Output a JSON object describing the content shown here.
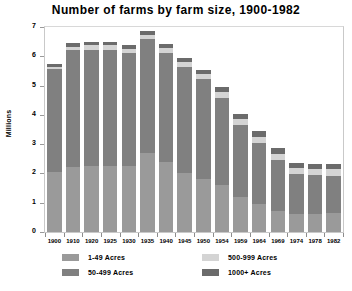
{
  "chart_data": {
    "type": "bar",
    "subtype": "stacked-vertical",
    "title": "Number of farms by farm size, 1900-1982",
    "xlabel": "",
    "ylabel": "Millions",
    "ylim": [
      0,
      7
    ],
    "yticks": [
      0,
      1,
      2,
      3,
      4,
      5,
      6,
      7
    ],
    "grid": false,
    "legend_position": "bottom",
    "categories": [
      "1900",
      "1910",
      "1920",
      "1925",
      "1930",
      "1935",
      "1940",
      "1945",
      "1950",
      "1954",
      "1959",
      "1964",
      "1969",
      "1974",
      "1978",
      "1982"
    ],
    "series": [
      {
        "name": "1-49 Acres",
        "color": "#9a9a9a",
        "values": [
          2.05,
          2.22,
          2.26,
          2.24,
          2.27,
          2.7,
          2.38,
          2.02,
          1.81,
          1.61,
          1.21,
          0.95,
          0.73,
          0.62,
          0.62,
          0.64
        ]
      },
      {
        "name": "50-499 Acres",
        "color": "#808080",
        "values": [
          3.5,
          3.98,
          3.96,
          3.97,
          3.83,
          3.88,
          3.73,
          3.61,
          3.4,
          2.98,
          2.44,
          2.1,
          1.72,
          1.37,
          1.32,
          1.29
        ]
      },
      {
        "name": "500-999 Acres",
        "color": "#d4d4d4",
        "values": [
          0.09,
          0.13,
          0.15,
          0.16,
          0.16,
          0.16,
          0.16,
          0.17,
          0.18,
          0.2,
          0.2,
          0.21,
          0.22,
          0.21,
          0.22,
          0.22
        ]
      },
      {
        "name": "1000+ Acres",
        "color": "#6b6b6b",
        "values": [
          0.1,
          0.12,
          0.12,
          0.12,
          0.13,
          0.13,
          0.14,
          0.15,
          0.16,
          0.17,
          0.18,
          0.19,
          0.2,
          0.16,
          0.16,
          0.16
        ]
      }
    ],
    "totals": [
      5.74,
      6.45,
      6.49,
      6.49,
      6.39,
      6.87,
      6.41,
      5.95,
      5.55,
      4.96,
      4.03,
      3.45,
      2.87,
      2.36,
      2.32,
      2.31
    ]
  },
  "legend": {
    "items": [
      {
        "label": "1-49 Acres",
        "color": "#9a9a9a"
      },
      {
        "label": "50-499 Acres",
        "color": "#808080"
      },
      {
        "label": "500-999 Acres",
        "color": "#d4d4d4"
      },
      {
        "label": "1000+ Acres",
        "color": "#6b6b6b"
      }
    ]
  },
  "colors": {
    "background": "#ffffff",
    "frame": "#c9c9c9",
    "text": "#000000"
  }
}
